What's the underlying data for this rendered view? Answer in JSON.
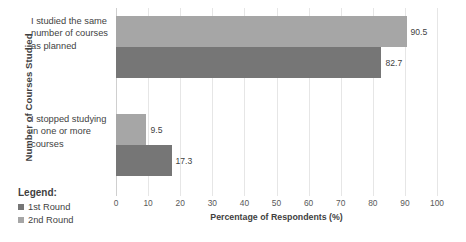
{
  "chart_data": {
    "type": "bar",
    "orientation": "horizontal",
    "title": "",
    "xlabel": "Percentage of Respondents (%)",
    "ylabel": "Number of Courses Studied",
    "categories": [
      "I studied the same number of courses as planned",
      "I stopped studying in one or more courses"
    ],
    "series": [
      {
        "name": "2nd Round",
        "color": "#a6a6a6",
        "values": [
          90.5,
          9.5
        ]
      },
      {
        "name": "1st Round",
        "color": "#767676",
        "values": [
          82.7,
          17.3
        ]
      }
    ],
    "xlim": [
      0,
      100
    ],
    "xticks": [
      0,
      10,
      20,
      30,
      40,
      50,
      60,
      70,
      80,
      90,
      100
    ],
    "xtick_labels": [
      "0",
      "10",
      "20",
      "30",
      "40",
      "50",
      "60",
      "70",
      "80",
      "90",
      "100"
    ],
    "grid": "vertical",
    "legend_position": "bottom-left",
    "data_labels": [
      "90.5",
      "82.7",
      "9.5",
      "17.3"
    ]
  },
  "legend": {
    "title": "Legend:",
    "items": [
      {
        "label": "1st Round",
        "color": "#767676"
      },
      {
        "label": "2nd Round",
        "color": "#a6a6a6"
      }
    ]
  },
  "axes": {
    "y_title": "Number of Courses Studied",
    "x_title": "Percentage of Respondents (%)"
  },
  "bars": [
    {
      "group": 0,
      "series": "2nd Round",
      "value": 90.5,
      "label": "90.5"
    },
    {
      "group": 0,
      "series": "1st Round",
      "value": 82.7,
      "label": "82.7"
    },
    {
      "group": 1,
      "series": "2nd Round",
      "value": 9.5,
      "label": "9.5"
    },
    {
      "group": 1,
      "series": "1st Round",
      "value": 17.3,
      "label": "17.3"
    }
  ]
}
